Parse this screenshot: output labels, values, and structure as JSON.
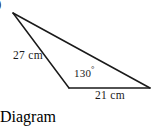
{
  "figure": {
    "kind": "triangle-diagram",
    "problem_tag": ")",
    "background_color": "#ffffff",
    "stroke_color": "#1a1a1a",
    "text_color": "#1a1a1a",
    "labels": {
      "side_left": "27 cm",
      "side_bottom": "21 cm",
      "angle": "130",
      "angle_unit": "°",
      "angle_full": "130°"
    },
    "vertices": {
      "apex": {
        "name": "apex-vertex",
        "x": 13,
        "y": 13
      },
      "bottom_left": {
        "name": "bottom-left-vertex",
        "x": 69,
        "y": 88
      },
      "bottom_right": {
        "name": "bottom-right-vertex",
        "x": 150,
        "y": 88
      }
    },
    "edges": [
      {
        "name": "left-side",
        "from": "apex",
        "to": "bottom_left",
        "label": "27 cm"
      },
      {
        "name": "bottom-side",
        "from": "bottom_left",
        "to": "bottom_right",
        "label": "21 cm"
      },
      {
        "name": "long-side",
        "from": "apex",
        "to": "bottom_right",
        "label": ""
      }
    ],
    "angles": [
      {
        "name": "interior-angle-bottom-left",
        "at": "bottom_left",
        "value": "130°"
      }
    ]
  }
}
